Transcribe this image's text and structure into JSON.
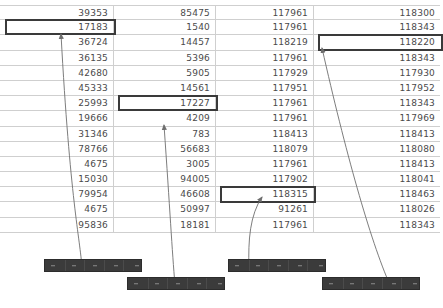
{
  "table": {
    "row_count": 15,
    "column_count": 4,
    "columns": [
      {
        "name": "column-1",
        "values": [
          "39353",
          "17183",
          "36724",
          "36135",
          "42680",
          "45333",
          "25993",
          "19666",
          "31346",
          "78766",
          "4675",
          "15030",
          "79954",
          "4675",
          "95836"
        ]
      },
      {
        "name": "column-2",
        "values": [
          "85475",
          "1540",
          "14457",
          "5396",
          "5905",
          "14561",
          "17227",
          "4209",
          "783",
          "56683",
          "3005",
          "94005",
          "46608",
          "50997",
          "18181"
        ]
      },
      {
        "name": "column-3",
        "values": [
          "117961",
          "117961",
          "118219",
          "117961",
          "117929",
          "117951",
          "117961",
          "117961",
          "118413",
          "118079",
          "117961",
          "117902",
          "118315",
          "91261",
          "117961"
        ]
      },
      {
        "name": "column-4",
        "values": [
          "118300",
          "118343",
          "118220",
          "118343",
          "117930",
          "117952",
          "118343",
          "117969",
          "118413",
          "118080",
          "118413",
          "118041",
          "118463",
          "118026",
          "118343"
        ]
      }
    ],
    "highlights": [
      {
        "name": "highlight-col1-row2",
        "column": 0,
        "row": 1,
        "value": "17183"
      },
      {
        "name": "highlight-col2-row7",
        "column": 1,
        "row": 6,
        "value": "17227"
      },
      {
        "name": "highlight-col4-row3",
        "column": 3,
        "row": 2,
        "value": "118220"
      },
      {
        "name": "highlight-col3-row13",
        "column": 2,
        "row": 12,
        "value": "118315"
      }
    ]
  },
  "thumbnails": [
    {
      "name": "thumbnail-bar-1",
      "segments": 5
    },
    {
      "name": "thumbnail-bar-2",
      "segments": 5
    },
    {
      "name": "thumbnail-bar-3",
      "segments": 5
    },
    {
      "name": "thumbnail-bar-4",
      "segments": 5
    }
  ],
  "connectors": [
    {
      "name": "connector-1",
      "from": "thumbnail-bar-1",
      "to": "highlight-col1-row2"
    },
    {
      "name": "connector-2",
      "from": "thumbnail-bar-2",
      "to": "highlight-col2-row7"
    },
    {
      "name": "connector-3",
      "from": "thumbnail-bar-3",
      "to": "highlight-col3-row13"
    },
    {
      "name": "connector-4",
      "from": "thumbnail-bar-4",
      "to": "highlight-col4-row3"
    }
  ],
  "colors": {
    "grid_line": "#cfcfcf",
    "text": "#4a4a4a",
    "highlight_border": "#3a3a3a",
    "bar_fill": "#3b3b3b",
    "connector": "#6e6e6e",
    "background": "#ffffff"
  }
}
